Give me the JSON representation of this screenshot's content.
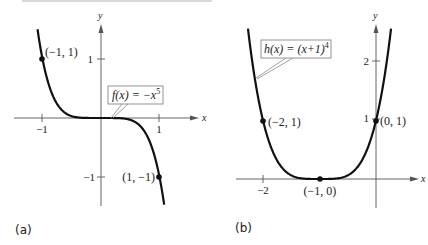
{
  "chart_data": [
    {
      "type": "line",
      "panel": "(a)",
      "title": "",
      "function_label": "f(x) = −x⁵",
      "expression": "-x^5",
      "xlabel": "x",
      "ylabel": "y",
      "x_ticks": [
        {
          "value": -1,
          "label": "−1"
        },
        {
          "value": 1,
          "label": "1"
        }
      ],
      "y_ticks": [
        {
          "value": 1,
          "label": "1"
        },
        {
          "value": -1,
          "label": "−1"
        }
      ],
      "xlim": [
        -1.7,
        1.65
      ],
      "ylim": [
        -1.5,
        1.6
      ],
      "grid": false,
      "points": [
        {
          "x": -1,
          "y": 1,
          "label": "(−1, 1)"
        },
        {
          "x": 1,
          "y": -1,
          "label": "(1, −1)"
        }
      ],
      "curve_domain": [
        -1.085,
        1.08
      ]
    },
    {
      "type": "line",
      "panel": "(b)",
      "title": "",
      "function_label": "h(x) = (x+1)⁴",
      "expression": "(x+1)^4",
      "xlabel": "x",
      "ylabel": "y",
      "x_ticks": [
        {
          "value": -2,
          "label": "−2"
        }
      ],
      "y_ticks": [
        {
          "value": 1,
          "label": "1"
        },
        {
          "value": 2,
          "label": "2"
        }
      ],
      "xlim": [
        -2.7,
        0.75
      ],
      "ylim": [
        -0.5,
        2.65
      ],
      "grid": false,
      "points": [
        {
          "x": -2,
          "y": 1,
          "label": "(−2, 1)"
        },
        {
          "x": -1,
          "y": 0,
          "label": "(−1, 0)"
        },
        {
          "x": 0,
          "y": 1,
          "label": "(0, 1)"
        }
      ],
      "curve_domain": [
        -2.266,
        0.266
      ]
    }
  ],
  "figure": {
    "panel_a_label": "(a)",
    "panel_b_label": "(b)",
    "axis_x_label": "x",
    "axis_y_label": "y",
    "func_a": {
      "prefix": "f(x) = −x",
      "exp": "5"
    },
    "func_b": {
      "prefix": "h(x) = (x+1)",
      "exp": "4"
    }
  }
}
